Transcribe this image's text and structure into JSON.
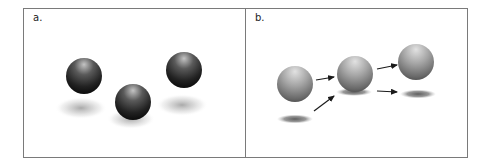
{
  "figure": {
    "panels": [
      {
        "label": "a.",
        "spheres": [
          {
            "cx": 84,
            "cy": 76,
            "r": 18,
            "tone": "dark"
          },
          {
            "cx": 133,
            "cy": 102,
            "r": 18,
            "tone": "dark"
          },
          {
            "cx": 184,
            "cy": 70,
            "r": 18,
            "tone": "dark"
          }
        ],
        "shadows": [
          {
            "cx": 81,
            "cy": 108,
            "rx": 24,
            "ry": 9,
            "style": "blurry-halo"
          },
          {
            "cx": 131,
            "cy": 119,
            "rx": 22,
            "ry": 8,
            "style": "blurry-halo"
          },
          {
            "cx": 182,
            "cy": 105,
            "rx": 24,
            "ry": 9,
            "style": "blurry-halo"
          }
        ]
      },
      {
        "label": "b.",
        "spheres": [
          {
            "cx": 295,
            "cy": 84,
            "r": 18,
            "tone": "light"
          },
          {
            "cx": 355,
            "cy": 74,
            "r": 18,
            "tone": "light"
          },
          {
            "cx": 416,
            "cy": 62,
            "r": 18,
            "tone": "light"
          }
        ],
        "shadows": [
          {
            "cx": 295,
            "cy": 119,
            "rx": 17,
            "ry": 3.5,
            "style": "sharp"
          },
          {
            "cx": 354,
            "cy": 92,
            "rx": 17,
            "ry": 3.5,
            "style": "sharp"
          },
          {
            "cx": 418,
            "cy": 94,
            "rx": 17,
            "ry": 3.5,
            "style": "sharp"
          }
        ],
        "arrows": [
          {
            "x1": 316,
            "y1": 80,
            "x2": 334,
            "y2": 77
          },
          {
            "x1": 314,
            "y1": 111,
            "x2": 334,
            "y2": 96
          },
          {
            "x1": 377,
            "y1": 69,
            "x2": 397,
            "y2": 65
          },
          {
            "x1": 377,
            "y1": 91,
            "x2": 397,
            "y2": 92
          }
        ]
      }
    ],
    "colors": {
      "border": "#7a7a7a",
      "background": "#ffffff",
      "arrow": "#1a1a1a",
      "sphere_dark_highlight": "#b8b8b8",
      "sphere_dark_mid": "#4a4a4a",
      "sphere_dark_edge": "#111111",
      "sphere_light_highlight": "#d8d8d8",
      "sphere_light_mid": "#9a9a9a",
      "sphere_light_edge": "#4a4a4a",
      "shadow": "#777777"
    }
  }
}
